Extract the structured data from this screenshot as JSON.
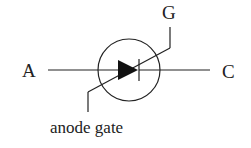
{
  "diagram": {
    "title": "",
    "symbol": "thyristor (anode gate)",
    "labels": {
      "anode": "A",
      "cathode": "C",
      "gate": "G",
      "anode_gate": "anode gate"
    },
    "colors": {
      "stroke": "#222222",
      "background": "#ffffff"
    }
  }
}
